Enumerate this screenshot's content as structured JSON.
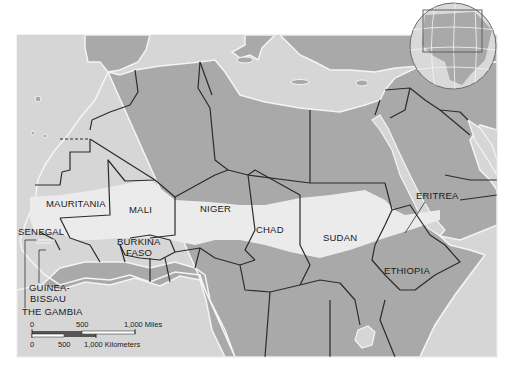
{
  "map": {
    "region": "Sahel, North Africa",
    "colors": {
      "water": "#d6d6d6",
      "land": "#a9a9a9",
      "sahel_band": "#ebebeb",
      "border": "#2b2b2b",
      "coast": "#f4f4f4",
      "background": "#ffffff"
    },
    "labels": {
      "mauritania": "MAURITANIA",
      "mali": "MALI",
      "niger": "NIGER",
      "chad": "CHAD",
      "sudan": "SUDAN",
      "eritrea": "ERITREA",
      "ethiopia": "ETHIOPIA",
      "senegal": "SENEGAL",
      "burkina_1": "BURKINA",
      "burkina_2": "FASO",
      "guinea_bissau_1": "GUINEA-",
      "guinea_bissau_2": "BISSAU",
      "the_gambia": "THE GAMBIA"
    },
    "scale_bar": {
      "miles": {
        "ticks": [
          "0",
          "500",
          "1,000 Miles"
        ]
      },
      "kilometers": {
        "ticks": [
          "0",
          "500",
          "1,000 Kilometers"
        ]
      }
    },
    "locator_globe": {
      "highlighted": "North Africa"
    }
  }
}
